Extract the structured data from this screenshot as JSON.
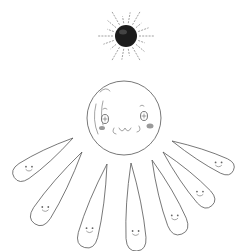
{
  "scene": {
    "title": "Sketch of a smiling round face with a dark sun above and seven teardrop-shaped petals/rays below",
    "subjects": [
      {
        "name": "dark-sun",
        "description": "Black ball with radiating dashed rays"
      },
      {
        "name": "round-face",
        "description": "Large smiling round face with blushing cheeks"
      },
      {
        "name": "teardrop-petals",
        "count": 7,
        "description": "Teardrop shapes with small smiling faces fanning out below the round face"
      }
    ],
    "colors": {
      "background": "#ffffff",
      "line": "#555555",
      "sun": "#1a1a1a",
      "blush": "#9a9a9a"
    }
  }
}
